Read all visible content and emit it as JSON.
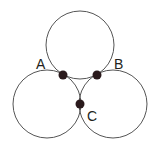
{
  "diagram": {
    "stroke_color": "#555555",
    "dot_color": "#2a1a1c",
    "circles": [
      {
        "name": "top",
        "cx": 80,
        "cy": 45,
        "r": 34
      },
      {
        "name": "left",
        "cx": 47,
        "cy": 104,
        "r": 34
      },
      {
        "name": "right",
        "cx": 113,
        "cy": 104,
        "r": 34
      }
    ],
    "points": [
      {
        "label": "A",
        "x": 63,
        "y": 75,
        "label_x": 38,
        "label_y": 67
      },
      {
        "label": "B",
        "x": 97,
        "y": 75,
        "label_x": 112,
        "label_y": 67
      },
      {
        "label": "C",
        "x": 80,
        "y": 104,
        "label_x": 86,
        "label_y": 120
      }
    ]
  }
}
